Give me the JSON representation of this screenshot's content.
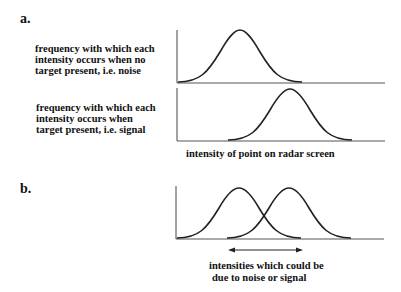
{
  "panels": {
    "a": {
      "label": "a.",
      "noise_desc": {
        "line1": "frequency with which each",
        "line2": "intensity occurs when no",
        "line3": "target present, i.e. noise"
      },
      "signal_desc": {
        "line1": "frequency with which each",
        "line2": "intensity occurs when",
        "line3": "target present, i.e. signal"
      },
      "x_axis_label": "intensity of point on radar screen"
    },
    "b": {
      "label": "b.",
      "overlap_label": {
        "line1": "intensities which could be",
        "line2": "due to noise or signal"
      }
    }
  },
  "colors": {
    "curve": "#222222",
    "axis": "#333333",
    "background": "#ffffff"
  }
}
